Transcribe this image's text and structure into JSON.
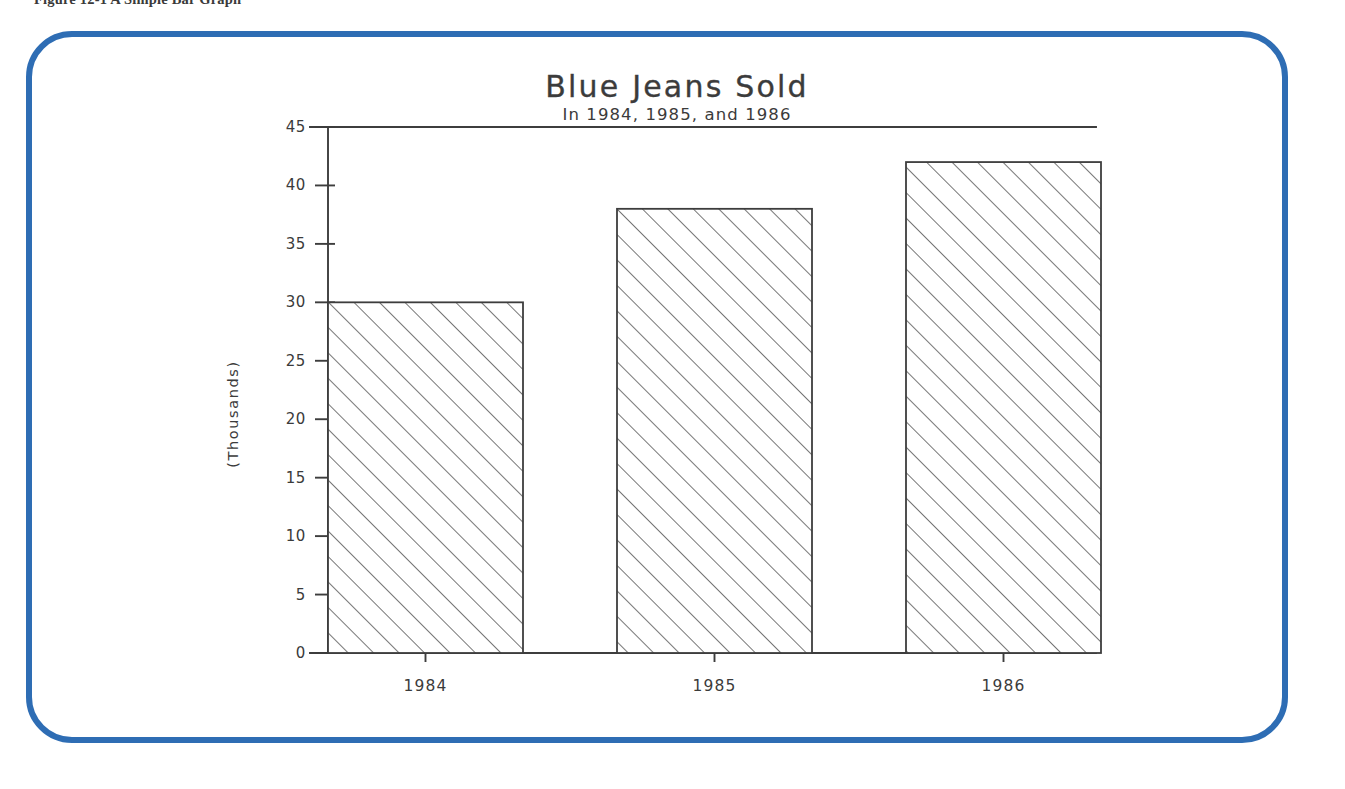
{
  "figure": {
    "caption": "Figure 12-1   A Simple Bar Graph",
    "frame_color": "#2e6db4"
  },
  "chart_data": {
    "type": "bar",
    "title": "Blue Jeans Sold",
    "subtitle": "In 1984, 1985, and 1986",
    "xlabel": "",
    "ylabel": "(Thousands)",
    "categories": [
      "1984",
      "1985",
      "1986"
    ],
    "values": [
      30,
      38,
      42
    ],
    "ylim": [
      0,
      45
    ],
    "ytick_step": 5,
    "ytick_labels": [
      "0",
      "5",
      "10",
      "15",
      "20",
      "25",
      "30",
      "35",
      "40",
      "45"
    ],
    "grid": false,
    "legend": "none",
    "bar_fill": "diagonal-hatch",
    "line_color": "#3d3d3d",
    "series": [
      {
        "name": "Blue Jeans Sold",
        "values": [
          30,
          38,
          42
        ]
      }
    ]
  }
}
